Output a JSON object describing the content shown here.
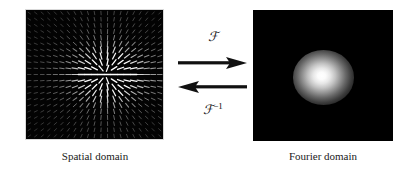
{
  "figure": {
    "type": "fourier-transform-pair-diagram",
    "background_color": "#ffffff",
    "panel_background_color": "#000000",
    "panel_border_color": "#d9d9d9",
    "ink_color": "#111111"
  },
  "left_panel": {
    "name": "spatial-domain-image",
    "caption": "Spatial domain",
    "content_type": "vector-field",
    "background_color": "#030303",
    "glyph_color": "#ffffff",
    "grid_columns": 21,
    "grid_rows": 21,
    "description": "quiver field of short bright line segments radiating from centre with a bright horizontal-flow band right of centre"
  },
  "right_panel": {
    "name": "fourier-domain-image",
    "caption": "Fourier domain",
    "content_type": "gaussian-blob",
    "background_color": "#000000",
    "blob_color": "#ffffff",
    "blob_center_x_pct": 50.5,
    "blob_center_y_pct": 51.5,
    "blob_radius_pct": 22
  },
  "transform": {
    "forward_label": "ℱ",
    "forward_label_plain": "F",
    "inverse_label": "ℱ",
    "inverse_superscript": "−1",
    "inverse_label_plain": "F-1",
    "forward_arrow_direction": "right",
    "inverse_arrow_direction": "left",
    "arrow_color": "#111111"
  },
  "chart_data": {
    "type": "heatmap",
    "title": "",
    "panels": [
      {
        "name": "Spatial domain",
        "render": "vector-field",
        "xlabel": "",
        "ylabel": "",
        "grid": false,
        "colormap": "gray",
        "value_range": [
          0,
          1
        ]
      },
      {
        "name": "Fourier domain",
        "render": "magnitude-spectrum",
        "xlabel": "",
        "ylabel": "",
        "grid": false,
        "colormap": "gray",
        "value_range": [
          0,
          1
        ],
        "peak": {
          "x_pct": 50.5,
          "y_pct": 51.5,
          "value": 1.0
        },
        "falloff": "gaussian"
      }
    ],
    "annotations": [
      "ℱ",
      "ℱ⁻¹"
    ],
    "legend": "none"
  }
}
